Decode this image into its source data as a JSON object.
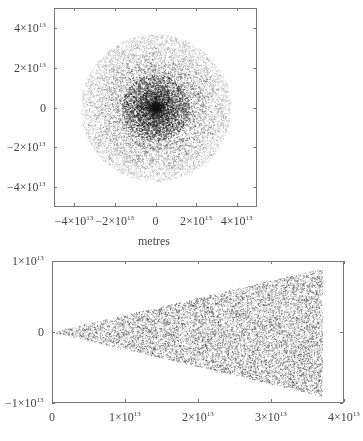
{
  "chart_data": [
    {
      "type": "scatter",
      "panel": "top",
      "title": "",
      "xlabel": "metres",
      "ylabel": "",
      "xlim": [
        -50000000000000.0,
        50000000000000.0
      ],
      "ylim": [
        -50000000000000.0,
        50000000000000.0
      ],
      "x_ticks": [
        {
          "value": -40000000000000.0,
          "label": "−4×10",
          "exp": "13"
        },
        {
          "value": -20000000000000.0,
          "label": "−2×10",
          "exp": "13"
        },
        {
          "value": 0,
          "label": "0",
          "exp": ""
        },
        {
          "value": 20000000000000.0,
          "label": "2×10",
          "exp": "13"
        },
        {
          "value": 40000000000000.0,
          "label": "4×10",
          "exp": "13"
        }
      ],
      "y_ticks": [
        {
          "value": 40000000000000.0,
          "label": "4×10",
          "exp": "13"
        },
        {
          "value": 20000000000000.0,
          "label": "2×10",
          "exp": "13"
        },
        {
          "value": 0,
          "label": "0",
          "exp": ""
        },
        {
          "value": -20000000000000.0,
          "label": "−2×10",
          "exp": "13"
        },
        {
          "value": -40000000000000.0,
          "label": "−4×10",
          "exp": "13"
        }
      ],
      "description": "Circular disc of points centred at origin, radius ≈ 3.7×10^13 m, density highest at centre",
      "disc": {
        "center": [
          0,
          0
        ],
        "radius": 37000000000000.0
      },
      "grid": false,
      "legend": null
    },
    {
      "type": "scatter",
      "panel": "bottom",
      "title": "",
      "xlabel": "",
      "ylabel": "",
      "xlim": [
        0,
        40000000000000.0
      ],
      "ylim": [
        -10000000000000.0,
        10000000000000.0
      ],
      "x_ticks": [
        {
          "value": 0,
          "label": "0",
          "exp": ""
        },
        {
          "value": 10000000000000.0,
          "label": "1×10",
          "exp": "13"
        },
        {
          "value": 20000000000000.0,
          "label": "2×10",
          "exp": "13"
        },
        {
          "value": 30000000000000.0,
          "label": "3×10",
          "exp": "13"
        },
        {
          "value": 40000000000000.0,
          "label": "4×10",
          "exp": "13"
        }
      ],
      "y_ticks": [
        {
          "value": 10000000000000.0,
          "label": "1×10",
          "exp": "13"
        },
        {
          "value": 0,
          "label": "0",
          "exp": ""
        },
        {
          "value": -10000000000000.0,
          "label": "−1×10",
          "exp": "13"
        }
      ],
      "description": "Wedge/cone of points with apex at origin, opening to half-width ≈ 0.9×10^13 at x ≈ 3.7×10^13",
      "wedge": {
        "apex": [
          0,
          0
        ],
        "end_x": 37000000000000.0,
        "half_width_at_end": 9000000000000.0
      },
      "grid": false,
      "legend": null
    }
  ],
  "axes_labels": {
    "top_x": "metres"
  }
}
